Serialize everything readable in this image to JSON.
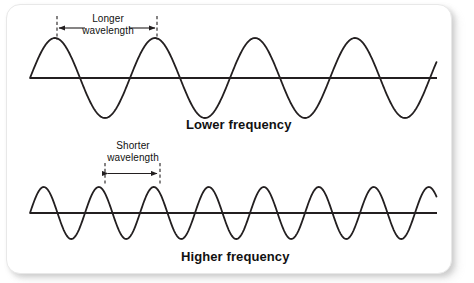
{
  "figure": {
    "title_visible": false,
    "background_color": "#ffffff",
    "card_color": "#ffffff",
    "stroke_color": "#231f20",
    "text_color": "#111111"
  },
  "annotations": {
    "longer_wavelength": {
      "line1": "Longer",
      "line2": "wavelength",
      "text": "Longer wavelength"
    },
    "shorter_wavelength": {
      "line1": "Shorter",
      "line2": "wavelength",
      "text": "Shorter wavelength"
    },
    "lower_frequency": "Lower frequency",
    "higher_frequency": "Higher frequency"
  },
  "chart_data": {
    "type": "line",
    "title": "",
    "subtitle": "",
    "xlabel": "",
    "ylabel": "",
    "grid": false,
    "legend_position": "none",
    "axis_ranges": {
      "x": [
        0,
        474
      ],
      "y": [
        0,
        283
      ]
    },
    "series": [
      {
        "name": "Lower frequency",
        "label": "Lower frequency",
        "waveform": "sine",
        "cycles": 4,
        "wavelength_px": 100,
        "amplitude_px": 40,
        "baseline_y_px": 78,
        "x_start_px": 30,
        "x_end_px": 437,
        "phase": "rising from baseline",
        "stroke_width": 1.8
      },
      {
        "name": "Higher frequency",
        "label": "Higher frequency",
        "waveform": "sine",
        "cycles": 8,
        "wavelength_px": 55,
        "amplitude_px": 26,
        "baseline_y_px": 213,
        "x_start_px": 30,
        "x_end_px": 437,
        "phase": "rising from baseline",
        "stroke_width": 1.8
      }
    ],
    "measure_bars": [
      {
        "name": "longer-wavelength-measure",
        "label": "Longer wavelength",
        "x1_px": 57,
        "x2_px": 157,
        "y_px": 28,
        "tick_top_px": 16,
        "tick_bottom_px": 40,
        "span_px": 100
      },
      {
        "name": "shorter-wavelength-measure",
        "label": "Shorter wavelength",
        "x1_px": 105,
        "x2_px": 160,
        "y_px": 173,
        "tick_top_px": 163,
        "tick_bottom_px": 184,
        "span_px": 55
      }
    ]
  }
}
